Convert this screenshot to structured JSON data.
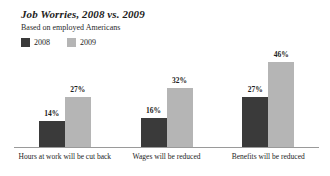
{
  "chart_data": {
    "type": "bar",
    "title": "Job Worries, 2008 vs. 2009",
    "subtitle": "Based on employed Americans",
    "xlabel": "",
    "ylabel": "",
    "ylim": [
      0,
      50
    ],
    "grid": false,
    "legend_position": "top-left",
    "categories": [
      "Hours at work will be cut back",
      "Wages will be reduced",
      "Benefits will be reduced"
    ],
    "series": [
      {
        "name": "2008",
        "color": "#3a3a3a",
        "values": [
          14,
          16,
          27
        ],
        "labels": [
          "14%",
          "16%",
          "27%"
        ]
      },
      {
        "name": "2009",
        "color": "#b5b5b5",
        "values": [
          27,
          32,
          46
        ],
        "labels": [
          "27%",
          "32%",
          "46%"
        ]
      }
    ]
  },
  "legend": {
    "items": [
      {
        "label": "2008",
        "color": "#3a3a3a"
      },
      {
        "label": "2009",
        "color": "#b5b5b5"
      }
    ]
  },
  "colors": {
    "series_2008": "#3a3a3a",
    "series_2009": "#b5b5b5",
    "axis": "#9a9a9a",
    "text": "#1d1d1d",
    "background": "#ffffff"
  }
}
